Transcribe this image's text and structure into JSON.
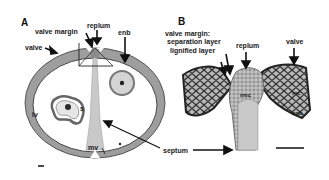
{
  "figure": {
    "panels": [
      {
        "id": "A",
        "letter": "A",
        "labels": {
          "valve": "valve",
          "valve_margin": "valve margin",
          "replum": "replum",
          "enb": "enb",
          "lv": "lv",
          "s": "s",
          "mv": "mv"
        }
      },
      {
        "id": "B",
        "letter": "B",
        "labels": {
          "valve_margin_title": "valve margin:",
          "separation_layer": "separation layer",
          "lignified_layer": "lignified layer",
          "replum": "replum",
          "valve": "valve",
          "rmc": "rmc",
          "mc": "mc",
          "enb": "enb"
        }
      }
    ],
    "shared_labels": {
      "septum": "septum"
    },
    "colors": {
      "tissue": "#9c9c9c",
      "tissue_dark": "#3a3a3a",
      "cell_fill": "#bdbdbd",
      "septum": "#c8c8c8",
      "background": "#ffffff",
      "text": "#1a1a1a"
    }
  }
}
